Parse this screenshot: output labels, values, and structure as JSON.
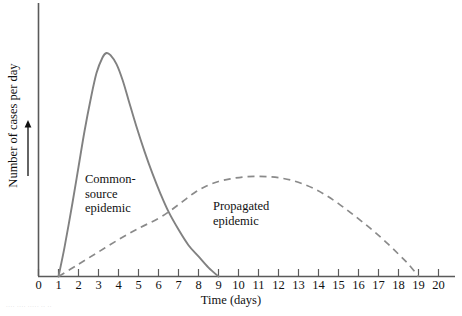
{
  "chart_data": {
    "type": "line",
    "title": "",
    "xlabel": "Time (days)",
    "ylabel": "Number of cases per day",
    "xlim": [
      0,
      20
    ],
    "ylim": [
      0,
      1
    ],
    "grid": false,
    "legend": "none",
    "xticks": [
      "0",
      "1",
      "2",
      "3",
      "4",
      "5",
      "6",
      "7",
      "8",
      "9",
      "10",
      "11",
      "12",
      "13",
      "14",
      "15",
      "16",
      "17",
      "18",
      "19",
      "20"
    ],
    "yticks": [],
    "annotations": [
      {
        "name": "common-source-epidemic",
        "text": "Common-\nsource\nepidemic",
        "x_day": 3.4,
        "y_rel": 0.38
      },
      {
        "name": "propagated-epidemic",
        "text": "Propagated\nepidemic",
        "x_day": 11.2,
        "y_rel": 0.28
      }
    ],
    "series": [
      {
        "name": "Common-source epidemic",
        "style": "solid",
        "color": "#818181",
        "x": [
          1.0,
          1.3,
          1.7,
          2.0,
          2.3,
          2.6,
          2.9,
          3.2,
          3.4,
          3.6,
          3.9,
          4.2,
          4.5,
          4.9,
          5.3,
          5.7,
          6.1,
          6.5,
          7.0,
          7.5,
          8.0,
          8.5,
          9.0
        ],
        "y": [
          0.0,
          0.13,
          0.33,
          0.49,
          0.65,
          0.79,
          0.91,
          0.98,
          1.0,
          0.99,
          0.95,
          0.88,
          0.79,
          0.67,
          0.56,
          0.46,
          0.37,
          0.29,
          0.21,
          0.14,
          0.09,
          0.04,
          0.0
        ]
      },
      {
        "name": "Propagated epidemic",
        "style": "dashed",
        "color": "#8a8a8a",
        "x": [
          1.0,
          2.0,
          3.0,
          4.0,
          5.0,
          6.0,
          6.6,
          7.2,
          7.8,
          8.4,
          9.0,
          9.6,
          10.2,
          10.8,
          11.4,
          12.0,
          12.6,
          13.2,
          13.8,
          14.4,
          15.0,
          15.6,
          16.2,
          16.8,
          17.4,
          18.0,
          18.5,
          19.0
        ],
        "y": [
          0.0,
          0.055,
          0.11,
          0.165,
          0.215,
          0.26,
          0.295,
          0.335,
          0.375,
          0.405,
          0.425,
          0.437,
          0.445,
          0.448,
          0.447,
          0.442,
          0.432,
          0.415,
          0.392,
          0.362,
          0.326,
          0.286,
          0.244,
          0.2,
          0.152,
          0.1,
          0.055,
          0.0
        ]
      }
    ]
  },
  "caption_fragment": "···· ···· ····· ·· ··",
  "colors": {
    "axis": "#5a5a5a",
    "text": "#111111",
    "solid_curve": "#818181",
    "dashed_curve": "#8a8a8a",
    "background": "#ffffff"
  }
}
